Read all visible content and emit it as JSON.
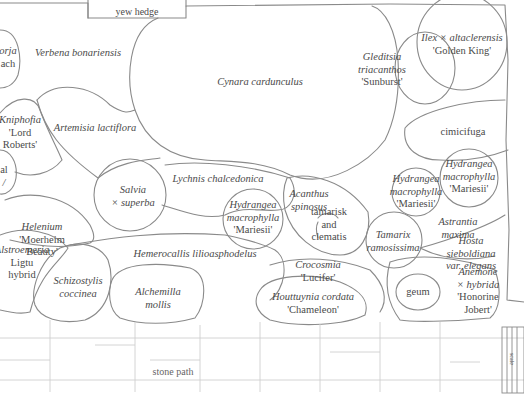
{
  "diagram": {
    "type": "garden planting plan",
    "stroke_color": "#8a8a8a",
    "text_color": "#4a4a4a"
  },
  "boundaries": {
    "hedge": "yew hedge",
    "path": "stone path",
    "scale": "scale"
  },
  "plants": [
    {
      "id": "verbena",
      "lines": [
        {
          "t": "Verbena bonariensis",
          "i": true
        }
      ]
    },
    {
      "id": "cynara",
      "lines": [
        {
          "t": "Cynara cardunculus",
          "i": true
        }
      ]
    },
    {
      "id": "gleditsia",
      "lines": [
        {
          "t": "Gleditsia",
          "i": true
        },
        {
          "t": "triacanthos",
          "i": true
        },
        {
          "t": "'Sunburst'",
          "i": false
        }
      ]
    },
    {
      "id": "ilex",
      "lines": [
        {
          "t": "Ilex × altaclerensis",
          "i": true
        },
        {
          "t": "'Golden King'",
          "i": false
        }
      ]
    },
    {
      "id": "left-top",
      "lines": [
        {
          "t": "orja",
          "i": true
        },
        {
          "t": "ach",
          "i": false
        }
      ]
    },
    {
      "id": "kniphofia",
      "lines": [
        {
          "t": "Kniphofia",
          "i": true
        },
        {
          "t": "'Lord",
          "i": false
        },
        {
          "t": "Roberts'",
          "i": false
        }
      ]
    },
    {
      "id": "artemisia",
      "lines": [
        {
          "t": "Artemisia lactiflora",
          "i": true
        }
      ]
    },
    {
      "id": "cimicifuga",
      "lines": [
        {
          "t": "cimicifuga",
          "i": false
        }
      ]
    },
    {
      "id": "left-mid",
      "lines": [
        {
          "t": "al",
          "i": false
        },
        {
          "t": "/",
          "i": true
        }
      ]
    },
    {
      "id": "lychnis",
      "lines": [
        {
          "t": "Lychnis chalcedonica",
          "i": true
        }
      ]
    },
    {
      "id": "salvia",
      "lines": [
        {
          "t": "Salvia",
          "i": true
        },
        {
          "t": "× superba",
          "i": true
        }
      ]
    },
    {
      "id": "helenium",
      "lines": [
        {
          "t": "Helenium",
          "i": true
        },
        {
          "t": "'Moerheim",
          "i": false
        },
        {
          "t": "Beauty'",
          "i": false
        }
      ]
    },
    {
      "id": "hydrangea-1",
      "lines": [
        {
          "t": "Hydrangea",
          "i": true
        },
        {
          "t": "macrophylla",
          "i": true
        },
        {
          "t": "'Mariesii'",
          "i": false
        }
      ]
    },
    {
      "id": "acanthus",
      "lines": [
        {
          "t": "Acanthus",
          "i": true
        },
        {
          "t": "spinosus",
          "i": true
        }
      ]
    },
    {
      "id": "tamarisk",
      "lines": [
        {
          "t": "tamarisk",
          "i": false
        },
        {
          "t": "and",
          "i": false
        },
        {
          "t": "clematis",
          "i": false
        }
      ]
    },
    {
      "id": "hydrangea-2",
      "lines": [
        {
          "t": "Hydrangea",
          "i": true
        },
        {
          "t": "macrophylla",
          "i": true
        },
        {
          "t": "'Mariesii'",
          "i": false
        }
      ]
    },
    {
      "id": "hydrangea-3",
      "lines": [
        {
          "t": "Hydrangea",
          "i": true
        },
        {
          "t": "macrophylla",
          "i": true
        },
        {
          "t": "'Mariesii'",
          "i": false
        }
      ]
    },
    {
      "id": "tamarix",
      "lines": [
        {
          "t": "Tamarix",
          "i": true
        },
        {
          "t": "ramosissima",
          "i": true
        }
      ]
    },
    {
      "id": "astrantia",
      "lines": [
        {
          "t": "Astrantia",
          "i": true
        },
        {
          "t": "maxima",
          "i": true
        }
      ]
    },
    {
      "id": "hosta",
      "lines": [
        {
          "t": "Hosta",
          "i": true
        },
        {
          "t": "sieboldiana",
          "i": true
        },
        {
          "t": "var. elegans",
          "i": true
        }
      ]
    },
    {
      "id": "alstroemeria",
      "lines": [
        {
          "t": "Alstroemeria",
          "i": true
        },
        {
          "t": "Ligtu",
          "i": false
        },
        {
          "t": "hybrid",
          "i": false
        }
      ]
    },
    {
      "id": "hemerocallis",
      "lines": [
        {
          "t": "Hemerocallis lilioasphodelus",
          "i": true
        }
      ]
    },
    {
      "id": "schizostylis",
      "lines": [
        {
          "t": "Schizostylis",
          "i": true
        },
        {
          "t": "coccinea",
          "i": true
        }
      ]
    },
    {
      "id": "crocosmia",
      "lines": [
        {
          "t": "Crocosmia",
          "i": true
        },
        {
          "t": "'Lucifer'",
          "i": false
        }
      ]
    },
    {
      "id": "alchemilla",
      "lines": [
        {
          "t": "Alchemilla",
          "i": true
        },
        {
          "t": "mollis",
          "i": true
        }
      ]
    },
    {
      "id": "houttuynia",
      "lines": [
        {
          "t": "Houttuynia cordata",
          "i": true
        },
        {
          "t": "'Chameleon'",
          "i": false
        }
      ]
    },
    {
      "id": "geum",
      "lines": [
        {
          "t": "geum",
          "i": false
        }
      ]
    },
    {
      "id": "anemone",
      "lines": [
        {
          "t": "Anemone",
          "i": true
        },
        {
          "t": "× hybrida",
          "i": true
        },
        {
          "t": "'Honorine",
          "i": false
        },
        {
          "t": "Jobert'",
          "i": false
        }
      ]
    }
  ]
}
